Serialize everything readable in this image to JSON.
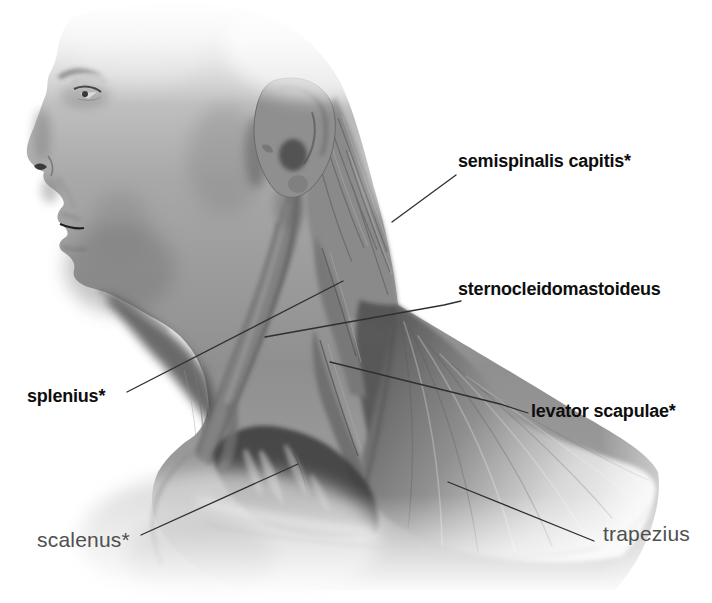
{
  "figure": {
    "type": "anatomical-illustration",
    "style": "grayscale airbrushed medical illustration on white background",
    "background_color": "#ffffff",
    "colors": {
      "label_primary": "#0e0e0e",
      "label_secondary": "#4f4f4f",
      "leader_line": "#2f2f2f"
    },
    "labels": [
      {
        "id": "semispinalis-capitis",
        "text": "semispinalis capitis*",
        "emphasis": "bold"
      },
      {
        "id": "sternocleidomastoideus",
        "text": "sternocleidomastoideus",
        "emphasis": "bold"
      },
      {
        "id": "splenius",
        "text": "splenius*",
        "emphasis": "bold"
      },
      {
        "id": "levator-scapulae",
        "text": "levator scapulae*",
        "emphasis": "bold"
      },
      {
        "id": "scalenus",
        "text": "scalenus*",
        "emphasis": "regular-gray"
      },
      {
        "id": "trapezius",
        "text": "trapezius",
        "emphasis": "regular-gray"
      }
    ],
    "footnote_marker": "*"
  }
}
